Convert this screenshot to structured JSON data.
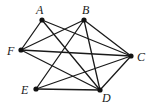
{
  "diagram": {
    "type": "graph",
    "nodes": [
      {
        "id": "A",
        "label": "A",
        "x": 42,
        "y": 20,
        "lx": 36,
        "ly": 14
      },
      {
        "id": "B",
        "label": "B",
        "x": 84,
        "y": 20,
        "lx": 82,
        "ly": 14
      },
      {
        "id": "C",
        "label": "C",
        "x": 131,
        "y": 56,
        "lx": 137,
        "ly": 61
      },
      {
        "id": "D",
        "label": "D",
        "x": 100,
        "y": 90,
        "lx": 102,
        "ly": 102
      },
      {
        "id": "E",
        "label": "E",
        "x": 36,
        "y": 89,
        "lx": 21,
        "ly": 94
      },
      {
        "id": "F",
        "label": "F",
        "x": 21,
        "y": 50,
        "lx": 7,
        "ly": 55
      }
    ],
    "edges": [
      [
        "A",
        "F"
      ],
      [
        "A",
        "C"
      ],
      [
        "A",
        "D"
      ],
      [
        "B",
        "F"
      ],
      [
        "B",
        "C"
      ],
      [
        "B",
        "D"
      ],
      [
        "B",
        "E"
      ],
      [
        "F",
        "C"
      ],
      [
        "F",
        "D"
      ],
      [
        "E",
        "C"
      ],
      [
        "E",
        "D"
      ],
      [
        "C",
        "D"
      ]
    ]
  }
}
